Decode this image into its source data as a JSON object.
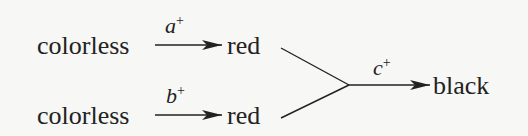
{
  "diagram": {
    "nodes": {
      "top_start": "colorless",
      "top_mid": "red",
      "bottom_start": "colorless",
      "bottom_mid": "red",
      "end": "black"
    },
    "edges": {
      "a": {
        "var": "a",
        "sign": "+"
      },
      "b": {
        "var": "b",
        "sign": "+"
      },
      "c": {
        "var": "c",
        "sign": "+"
      }
    }
  }
}
